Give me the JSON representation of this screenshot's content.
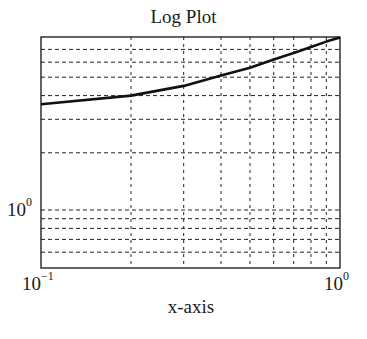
{
  "chart_data": {
    "type": "line",
    "title": "Log Plot",
    "xlabel": "x-axis",
    "ylabel": "",
    "xscale": "log",
    "yscale": "log",
    "xlim": [
      0.1,
      1.0
    ],
    "ylim": [
      0.5,
      8.1
    ],
    "grid": true,
    "grid_style": "dashed",
    "x_tick_labels": [
      {
        "base": "10",
        "exp": "−1",
        "value": 0.1
      },
      {
        "base": "10",
        "exp": "0",
        "value": 1.0
      }
    ],
    "y_tick_labels": [
      {
        "base": "10",
        "exp": "0",
        "value": 1.0
      }
    ],
    "x_minor_gridlines": [
      0.2,
      0.3,
      0.4,
      0.5,
      0.6,
      0.7,
      0.8,
      0.9
    ],
    "y_gridlines": [
      0.6,
      0.7,
      0.8,
      0.9,
      1,
      2,
      3,
      4,
      5,
      6,
      7
    ],
    "series": [
      {
        "name": "curve",
        "color": "#111111",
        "x": [
          0.1,
          0.2,
          0.3,
          0.4,
          0.5,
          0.6,
          0.7,
          0.8,
          0.9,
          1.0
        ],
        "y": [
          3.6,
          4.0,
          4.5,
          5.1,
          5.6,
          6.2,
          6.7,
          7.2,
          7.7,
          8.1
        ]
      }
    ],
    "legend": null
  }
}
